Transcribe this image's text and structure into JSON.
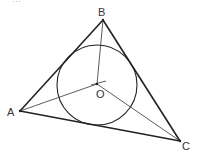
{
  "caption": "…",
  "diagram": {
    "points": {
      "A": {
        "label": "A",
        "x": 20,
        "y": 111
      },
      "B": {
        "label": "B",
        "x": 103,
        "y": 20
      },
      "C": {
        "label": "C",
        "x": 180,
        "y": 141
      },
      "O": {
        "label": "O",
        "x": 97,
        "y": 84
      }
    },
    "incircle": {
      "cx": 97,
      "cy": 85,
      "r": 40
    },
    "segments": [
      "AB",
      "BC",
      "CA",
      "OA",
      "OB",
      "OC"
    ],
    "colors": {
      "stroke": "#222222",
      "label": "#333333"
    }
  }
}
